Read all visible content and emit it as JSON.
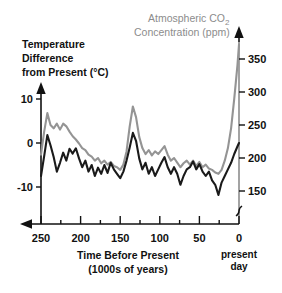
{
  "chart_data": {
    "type": "line",
    "title": "",
    "xlabel": "Time Before Present (1000s of years)",
    "xlabel_line1": "Time Before Present",
    "xlabel_line2": "(1000s of years)",
    "x_note": "present day",
    "x_note_line1": "present",
    "x_note_line2": "day",
    "xlim": [
      250,
      0
    ],
    "x_reversed": true,
    "x_ticks": [
      250,
      200,
      150,
      100,
      50,
      0
    ],
    "x_minor_ticks": [
      225,
      175,
      125,
      75,
      25
    ],
    "grid": false,
    "legend_position": "axis-labels",
    "axes": [
      {
        "id": "left",
        "label": "Temperature Difference from Present (°C)",
        "label_line1": "Temperature",
        "label_line2": "Difference",
        "label_line3": "from Present (°C)",
        "unit": "°C",
        "ticks": [
          10,
          0,
          -10
        ],
        "ylim": [
          -14,
          12
        ],
        "color": "#1a1a1a",
        "axis_break": false
      },
      {
        "id": "right",
        "label": "Atmospheric CO2 Concentration (ppm)",
        "label_line1": "Atmospheric CO",
        "label_sub": "2",
        "label_line2": "Concentration (ppm)",
        "unit": "ppm",
        "ticks": [
          150,
          200,
          250,
          300,
          350
        ],
        "ylim": [
          140,
          375
        ],
        "color": "#8c8c8c",
        "axis_break": true,
        "axis_break_note": "squiggle below 150 ppm"
      }
    ],
    "series": [
      {
        "name": "Temperature Difference from Present (°C)",
        "axis": "left",
        "color": "#1a1a1a",
        "unit": "°C",
        "x": [
          250,
          246,
          242,
          238,
          234,
          230,
          226,
          222,
          218,
          214,
          210,
          206,
          202,
          198,
          194,
          190,
          186,
          182,
          178,
          174,
          170,
          166,
          162,
          158,
          154,
          150,
          146,
          142,
          138,
          134,
          130,
          126,
          122,
          118,
          114,
          110,
          106,
          102,
          98,
          94,
          90,
          86,
          82,
          78,
          74,
          70,
          66,
          62,
          58,
          54,
          50,
          46,
          42,
          38,
          34,
          30,
          26,
          22,
          18,
          14,
          10,
          6,
          2,
          0
        ],
        "values": [
          -7.5,
          -3.0,
          1.8,
          -0.5,
          -3.2,
          -6.5,
          -4.5,
          -2.2,
          -4.0,
          -1.3,
          -2.4,
          -1.2,
          -3.5,
          -5.5,
          -4.0,
          -6.5,
          -5.0,
          -7.5,
          -5.6,
          -7.0,
          -5.0,
          -6.8,
          -4.5,
          -6.0,
          -7.0,
          -8.0,
          -6.5,
          -4.0,
          -1.0,
          2.3,
          0.5,
          -3.5,
          -6.0,
          -4.5,
          -7.0,
          -5.5,
          -7.5,
          -6.0,
          -4.5,
          -3.2,
          -5.5,
          -7.0,
          -5.5,
          -7.0,
          -9.5,
          -7.5,
          -6.0,
          -5.5,
          -4.2,
          -6.0,
          -4.8,
          -6.5,
          -7.5,
          -6.5,
          -8.5,
          -9.5,
          -11.8,
          -9.0,
          -7.5,
          -6.0,
          -4.5,
          -2.5,
          -0.8,
          0.0
        ]
      },
      {
        "name": "Atmospheric CO2 Concentration (ppm)",
        "axis": "right",
        "color": "#949494",
        "unit": "ppm",
        "x": [
          250,
          246,
          242,
          238,
          234,
          230,
          226,
          222,
          218,
          214,
          210,
          206,
          202,
          198,
          194,
          190,
          186,
          182,
          178,
          174,
          170,
          166,
          162,
          158,
          154,
          150,
          146,
          142,
          138,
          134,
          130,
          126,
          122,
          118,
          114,
          110,
          106,
          102,
          98,
          94,
          90,
          86,
          82,
          78,
          74,
          70,
          66,
          62,
          58,
          54,
          50,
          46,
          42,
          38,
          34,
          30,
          26,
          22,
          18,
          14,
          10,
          6,
          2,
          0
        ],
        "values": [
          205,
          240,
          268,
          250,
          245,
          252,
          243,
          252,
          248,
          240,
          233,
          228,
          222,
          215,
          212,
          205,
          202,
          196,
          200,
          192,
          196,
          190,
          194,
          188,
          186,
          182,
          190,
          210,
          248,
          278,
          262,
          232,
          215,
          206,
          212,
          204,
          210,
          206,
          212,
          218,
          205,
          196,
          200,
          193,
          186,
          192,
          196,
          190,
          196,
          188,
          194,
          186,
          190,
          184,
          182,
          178,
          176,
          182,
          196,
          215,
          245,
          290,
          340,
          372
        ]
      }
    ],
    "annotations": [
      {
        "text": "present day",
        "x": 0,
        "note": "below right end of x-axis"
      },
      {
        "text": "axis break",
        "axis": "right",
        "note": "below 150 ppm tick"
      }
    ]
  },
  "colors": {
    "temperature_line": "#1a1a1a",
    "co2_line": "#949494",
    "co2_label": "#8c8c8c",
    "axis": "#111111",
    "background": "#ffffff"
  }
}
